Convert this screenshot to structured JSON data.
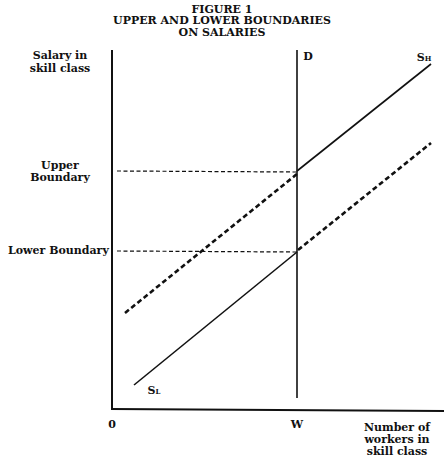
{
  "figure": {
    "number": "FIGURE 1",
    "title_line1": "UPPER AND LOWER BOUNDARIES",
    "title_line2": "ON SALARIES"
  },
  "axes": {
    "y_label_line1": "Salary in",
    "y_label_line2": "skill class",
    "x_label_line1": "Number of",
    "x_label_line2": "workers in",
    "x_label_line3": "skill class",
    "origin": "0",
    "x_mark": "W"
  },
  "levels": {
    "upper_line1": "Upper",
    "upper_line2": "Boundary",
    "lower": "Lower Boundary"
  },
  "curves": {
    "demand": "D",
    "supply_high": "S",
    "supply_high_sub": "H",
    "supply_low": "S",
    "supply_low_sub": "L"
  }
}
